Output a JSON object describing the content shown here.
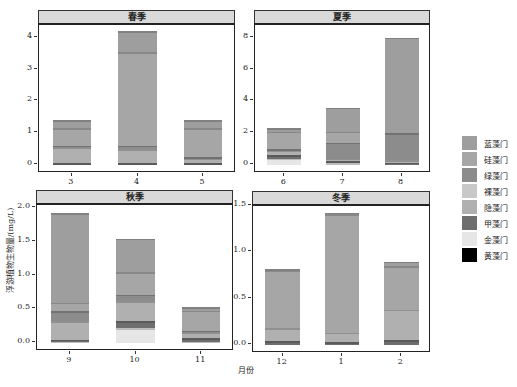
{
  "chart_data": {
    "type": "bar",
    "stacked": true,
    "xlabel": "月份",
    "ylabel": "浮游植物生物量/(mg/L)",
    "legend_position": "right",
    "grid": false,
    "series_order_bottom_to_top": [
      "黄藻门",
      "金藻门",
      "甲藻门",
      "隐藻门",
      "裸藻门",
      "绿藻门",
      "硅藻门",
      "蓝藻门"
    ],
    "legend": [
      {
        "name": "蓝藻门",
        "color": "#9e9e9e"
      },
      {
        "name": "硅藻门",
        "color": "#a6a6a6"
      },
      {
        "name": "绿藻门",
        "color": "#8c8c8c"
      },
      {
        "name": "裸藻门",
        "color": "#c8c8c8"
      },
      {
        "name": "隐藻门",
        "color": "#b0b0b0"
      },
      {
        "name": "甲藻门",
        "color": "#6e6e6e"
      },
      {
        "name": "金藻门",
        "color": "#e6e6e6"
      },
      {
        "name": "黄藻门",
        "color": "#000000"
      }
    ],
    "panels": [
      {
        "title": "春季",
        "categories": [
          "3",
          "4",
          "5"
        ],
        "ylim": [
          0,
          4.4
        ],
        "yticks": [
          "0",
          "1",
          "2",
          "3",
          "4"
        ],
        "series": [
          {
            "name": "黄藻门",
            "values": [
              0.0,
              0.0,
              0.0
            ]
          },
          {
            "name": "金藻门",
            "values": [
              0.0,
              0.0,
              0.0
            ]
          },
          {
            "name": "甲藻门",
            "values": [
              0.05,
              0.05,
              0.05
            ]
          },
          {
            "name": "隐藻门",
            "values": [
              0.5,
              0.45,
              0.15
            ]
          },
          {
            "name": "裸藻门",
            "values": [
              0.0,
              0.0,
              0.0
            ]
          },
          {
            "name": "绿藻门",
            "values": [
              0.05,
              0.1,
              0.05
            ]
          },
          {
            "name": "硅藻门",
            "values": [
              0.55,
              2.95,
              0.9
            ]
          },
          {
            "name": "蓝藻门",
            "values": [
              0.25,
              0.65,
              0.25
            ]
          }
        ],
        "totals": [
          1.4,
          4.2,
          1.4
        ]
      },
      {
        "title": "夏季",
        "categories": [
          "6",
          "7",
          "8"
        ],
        "ylim": [
          0,
          8.8
        ],
        "yticks": [
          "0",
          "2",
          "4",
          "6",
          "8"
        ],
        "series": [
          {
            "name": "黄藻门",
            "values": [
              0.0,
              0.0,
              0.0
            ]
          },
          {
            "name": "金藻门",
            "values": [
              0.4,
              0.1,
              0.0
            ]
          },
          {
            "name": "甲藻门",
            "values": [
              0.2,
              0.15,
              0.15
            ]
          },
          {
            "name": "隐藻门",
            "values": [
              0.3,
              0.15,
              0.15
            ]
          },
          {
            "name": "裸藻门",
            "values": [
              0.0,
              0.0,
              0.0
            ]
          },
          {
            "name": "绿藻门",
            "values": [
              0.1,
              1.0,
              1.7
            ]
          },
          {
            "name": "硅藻门",
            "values": [
              1.1,
              0.7,
              0.0
            ]
          },
          {
            "name": "蓝藻门",
            "values": [
              0.2,
              1.5,
              6.0
            ]
          }
        ],
        "totals": [
          2.3,
          3.6,
          8.0
        ]
      },
      {
        "title": "秋季",
        "categories": [
          "9",
          "10",
          "11"
        ],
        "ylim": [
          0,
          2.05
        ],
        "yticks": [
          "0.0",
          "0.5",
          "1.0",
          "1.5",
          "2.0"
        ],
        "series": [
          {
            "name": "黄藻门",
            "values": [
              0.0,
              0.0,
              0.0
            ]
          },
          {
            "name": "金藻门",
            "values": [
              0.02,
              0.22,
              0.02
            ]
          },
          {
            "name": "甲藻门",
            "values": [
              0.03,
              0.1,
              0.05
            ]
          },
          {
            "name": "隐藻门",
            "values": [
              0.27,
              0.3,
              0.08
            ]
          },
          {
            "name": "裸藻门",
            "values": [
              0.0,
              0.0,
              0.0
            ]
          },
          {
            "name": "绿藻门",
            "values": [
              0.15,
              0.1,
              0.03
            ]
          },
          {
            "name": "硅藻门",
            "values": [
              0.13,
              0.33,
              0.3
            ]
          },
          {
            "name": "蓝藻门",
            "values": [
              1.33,
              0.5,
              0.05
            ]
          }
        ],
        "totals": [
          1.93,
          1.55,
          0.53
        ]
      },
      {
        "title": "冬季",
        "categories": [
          "12",
          "1",
          "2"
        ],
        "ylim": [
          0,
          1.5
        ],
        "yticks": [
          "0.0",
          "0.5",
          "1.0",
          "1.5"
        ],
        "series": [
          {
            "name": "黄藻门",
            "values": [
              0.0,
              0.0,
              0.0
            ]
          },
          {
            "name": "金藻门",
            "values": [
              0.0,
              0.0,
              0.0
            ]
          },
          {
            "name": "甲藻门",
            "values": [
              0.04,
              0.03,
              0.05
            ]
          },
          {
            "name": "隐藻门",
            "values": [
              0.14,
              0.1,
              0.33
            ]
          },
          {
            "name": "裸藻门",
            "values": [
              0.0,
              0.0,
              0.0
            ]
          },
          {
            "name": "绿藻门",
            "values": [
              0.0,
              0.0,
              0.0
            ]
          },
          {
            "name": "硅藻门",
            "values": [
              0.62,
              1.28,
              0.47
            ]
          },
          {
            "name": "蓝藻门",
            "values": [
              0.02,
              0.02,
              0.05
            ]
          }
        ],
        "totals": [
          0.82,
          1.43,
          0.9
        ]
      }
    ]
  },
  "labels": {
    "xlabel": "月份",
    "ylabel": "浮游植物生物量/(mg/L)"
  }
}
